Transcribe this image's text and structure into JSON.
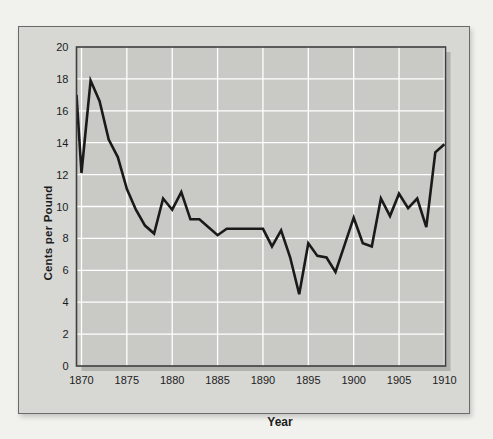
{
  "page": {
    "background": "#f1f2ee"
  },
  "panel": {
    "background": "#d7d7d4",
    "border_color": "#6a6a68"
  },
  "chart_data": {
    "type": "line",
    "xlabel": "Year",
    "ylabel": "Cents per Pound",
    "x": [
      1870,
      1871,
      1872,
      1873,
      1874,
      1875,
      1876,
      1877,
      1878,
      1879,
      1880,
      1881,
      1882,
      1883,
      1884,
      1885,
      1886,
      1887,
      1888,
      1889,
      1890,
      1891,
      1892,
      1893,
      1894,
      1895,
      1896,
      1897,
      1898,
      1899,
      1900,
      1901,
      1902,
      1903,
      1904,
      1905,
      1906,
      1907,
      1908,
      1909,
      1910
    ],
    "values": [
      12.1,
      17.9,
      16.6,
      14.2,
      13.1,
      11.1,
      9.8,
      8.8,
      8.3,
      10.5,
      9.8,
      10.9,
      9.2,
      9.2,
      8.7,
      8.2,
      8.6,
      8.6,
      8.6,
      8.6,
      8.6,
      7.5,
      8.5,
      6.8,
      4.5,
      7.7,
      6.9,
      6.8,
      5.9,
      7.6,
      9.3,
      7.7,
      7.5,
      10.5,
      9.4,
      10.8,
      9.9,
      10.5,
      8.7,
      13.4,
      13.9
    ],
    "edge_start": {
      "x": 1869.45,
      "value": 17.0
    },
    "xlim": [
      1869.45,
      1910.12
    ],
    "ylim": [
      0,
      20
    ],
    "x_ticks": [
      1870,
      1875,
      1880,
      1885,
      1890,
      1895,
      1900,
      1905,
      1910
    ],
    "y_ticks": [
      0,
      2,
      4,
      6,
      8,
      10,
      12,
      14,
      16,
      18,
      20
    ],
    "grid": true,
    "legend": "none",
    "colors": {
      "line": "#1a1a1a",
      "grid": "#ffffff",
      "plot_bg": "#c9c9c6",
      "plot_frame": "#3f3f3f",
      "plot_shadow": "#b2b2af",
      "text": "#1c1c1c"
    }
  }
}
